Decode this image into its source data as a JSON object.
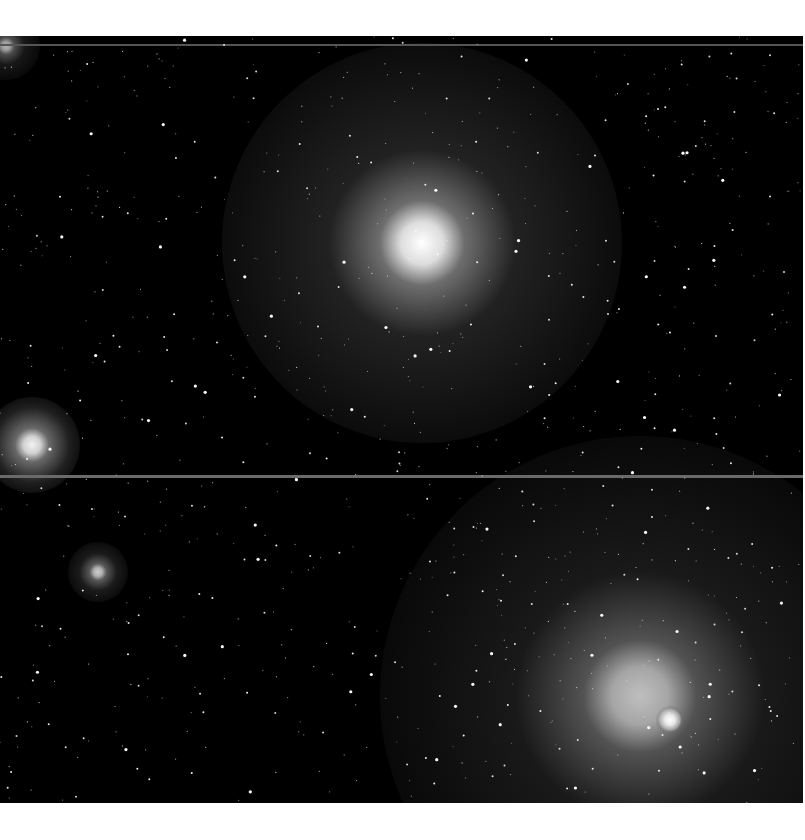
{
  "image": {
    "kind": "astronomical-starfield",
    "frame": {
      "x": 0,
      "y": 36,
      "width": 803,
      "height": 767,
      "background": "#000000"
    },
    "page_background": "#ffffff",
    "glows": [
      {
        "name": "large-glow-top-center",
        "cx": 422,
        "cy": 207,
        "core_r": 30,
        "halo_r": 200,
        "intensity": 1.0
      },
      {
        "name": "large-glow-bottom-right",
        "cx": 640,
        "cy": 660,
        "core_r": 40,
        "halo_r": 260,
        "intensity": 0.75
      },
      {
        "name": "bright-star-bottom-right",
        "cx": 670,
        "cy": 684,
        "core_r": 7,
        "halo_r": 14,
        "intensity": 1.0
      },
      {
        "name": "glow-left-middle",
        "cx": 32,
        "cy": 409,
        "core_r": 12,
        "halo_r": 48,
        "intensity": 0.95
      },
      {
        "name": "glow-left-lower",
        "cx": 98,
        "cy": 536,
        "core_r": 6,
        "halo_r": 30,
        "intensity": 0.8
      },
      {
        "name": "glow-top-left-corner",
        "cx": 6,
        "cy": 10,
        "core_r": 6,
        "halo_r": 34,
        "intensity": 0.7
      }
    ],
    "streaks": [
      {
        "name": "horizontal-streak-top",
        "y": 8,
        "height": 2,
        "color": "#555555"
      },
      {
        "name": "horizontal-streak-middle",
        "y": 439,
        "height": 3,
        "color": "#6a6a6a"
      }
    ],
    "star_count": 900,
    "star_seed": 7
  }
}
